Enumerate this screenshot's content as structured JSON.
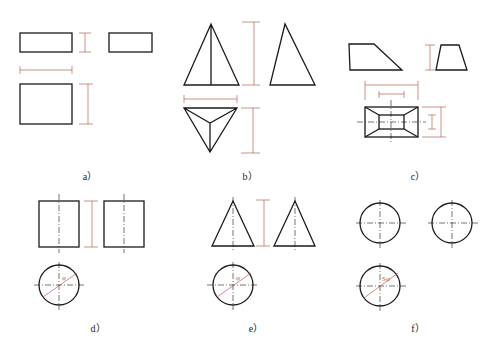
{
  "figure": {
    "panels": [
      {
        "id": "a",
        "label": "a）",
        "subject": "rectangular prism three views"
      },
      {
        "id": "b",
        "label": "b）",
        "subject": "triangular pyramid three views"
      },
      {
        "id": "c",
        "label": "c）",
        "subject": "frustum of rectangular pyramid three views"
      },
      {
        "id": "d",
        "label": "d）",
        "subject": "cylinder three views"
      },
      {
        "id": "e",
        "label": "e）",
        "subject": "cone three views"
      },
      {
        "id": "f",
        "label": "f）",
        "subject": "sphere three views"
      }
    ],
    "dimension_symbols": {
      "d": "φ",
      "e": "φ",
      "f": "Sφ"
    },
    "caption": "",
    "colors": {
      "object_line": "#1a1a1a",
      "dimension_line": "#b5624a"
    }
  }
}
